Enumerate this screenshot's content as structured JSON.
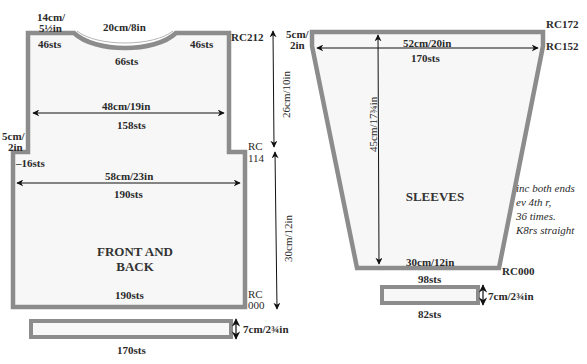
{
  "colors": {
    "outline": "#8c8c8c",
    "fill": "#f7f7f7",
    "text": "#2a2a2a",
    "arrow": "#111111"
  },
  "front_back": {
    "title_line1": "FRONT AND",
    "title_line2": "BACK",
    "shoulder_width_top": "14cm/",
    "shoulder_width_bottom": "5½in",
    "neck_width": "20cm/8in",
    "shoulder_left_sts": "46sts",
    "shoulder_right_sts": "46sts",
    "neck_sts": "66sts",
    "row_top": "RC212",
    "upper_width": "48cm/19in",
    "upper_sts": "158sts",
    "step_height_top": "5cm/",
    "step_height_bottom": "2in",
    "decrease": "–16sts",
    "row_mid_top": "RC",
    "row_mid_bottom": "114",
    "lower_width": "58cm/23in",
    "lower_sts": "190sts",
    "bottom_sts": "190sts",
    "row_bottom_top": "RC",
    "row_bottom_bottom": "000",
    "upper_height": "26cm/10in",
    "lower_height": "30cm/12in"
  },
  "front_band": {
    "height": "7cm/2¾in",
    "sts": "170sts"
  },
  "sleeves": {
    "title": "SLEEVES",
    "top_height_top": "5cm/",
    "top_height_bottom": "2in",
    "row_top": "RC172",
    "row_straight": "RC152",
    "top_width": "52cm/20in",
    "top_sts": "170sts",
    "length": "45cm/17¾in",
    "note_lines": [
      "inc both ends",
      "ev 4th r,",
      "36 times.",
      "K8rs straight"
    ],
    "bottom_width": "30cm/12in",
    "row_bottom": "RC000",
    "bottom_sts": "98sts"
  },
  "sleeve_band": {
    "height": "7cm/2¾in",
    "sts": "82sts"
  }
}
